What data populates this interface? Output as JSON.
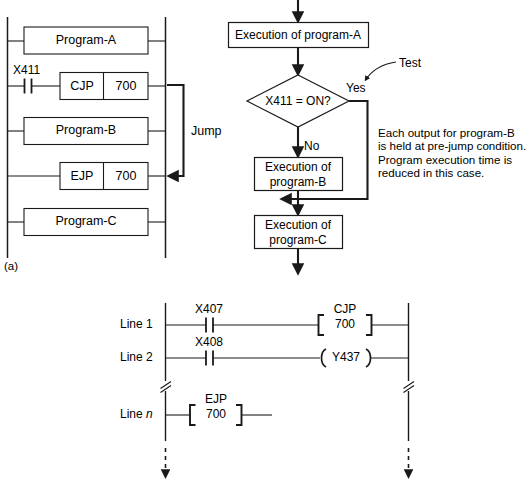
{
  "figure": {
    "part_label": "(a)",
    "ladder_top": {
      "name": "program-jump-ladder",
      "rungs": [
        {
          "id": "rung-program-a",
          "box_label": "Program-A"
        },
        {
          "id": "rung-cjp",
          "contact_label": "X411",
          "instruction": "CJP",
          "operand": "700"
        },
        {
          "id": "rung-program-b",
          "box_label": "Program-B"
        },
        {
          "id": "rung-ejp",
          "instruction": "EJP",
          "operand": "700"
        },
        {
          "id": "rung-program-c",
          "box_label": "Program-C"
        }
      ],
      "jump_annotation": "Jump"
    },
    "flowchart": {
      "name": "program-jump-flowchart",
      "box_a": "Execution of program-A",
      "decision": "X411 = ON?",
      "branch_yes": "Yes",
      "branch_no": "No",
      "box_b_line1": "Execution of",
      "box_b_line2": "program-B",
      "box_c_line1": "Execution of",
      "box_c_line2": "program-C",
      "callout_test": "Test",
      "note": "Each output for program-B\nis held at pre-jump condition.\nProgram execution time is\nreduced in this case."
    },
    "ladder_bottom": {
      "name": "line-numbered-ladder",
      "rows": [
        {
          "id": "ladder-row-line-1",
          "line_label": "Line 1",
          "contact_label": "X407",
          "output_kind": "bracket",
          "output_top": "CJP",
          "output_value": "700"
        },
        {
          "id": "ladder-row-line-2",
          "line_label": "Line 2",
          "contact_label": "X408",
          "output_kind": "coil",
          "output_top": "",
          "output_value": "Y437"
        },
        {
          "id": "ladder-row-line-n",
          "line_label_static": "Line ",
          "line_label_italic": "n",
          "contact_label": "",
          "output_kind": "bracket",
          "output_top": "EJP",
          "output_value": "700"
        }
      ]
    }
  },
  "colors": {
    "line": "#1a1a1a",
    "text": "#000000",
    "background": "#ffffff"
  }
}
